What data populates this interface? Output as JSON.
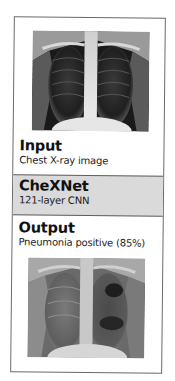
{
  "diagram": {
    "input": {
      "title": "Input",
      "subtitle": "Chest X-ray image",
      "image": "chest-xray-normal-icon"
    },
    "model": {
      "title": "CheXNet",
      "subtitle": "121-layer CNN",
      "background_color": "#dadada"
    },
    "output": {
      "title": "Output",
      "subtitle": "Pneumonia positive (85%)",
      "image": "chest-xray-pneumonia-icon"
    },
    "border_color": "#6b6b6b"
  }
}
